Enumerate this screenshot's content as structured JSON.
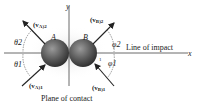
{
  "diagram": {
    "axes": {
      "x": "x",
      "y": "y"
    },
    "bodies": [
      {
        "label": "A"
      },
      {
        "label": "B"
      }
    ],
    "velocities": {
      "vA1": "(v",
      "vA1_sub": "A",
      "vA1_post": ")1",
      "vA2": "(v",
      "vA2_sub": "A",
      "vA2_post": ")2",
      "vB1": "(v",
      "vB1_sub": "B",
      "vB1_post": ")1",
      "vB2": "(v",
      "vB2_sub": "B",
      "vB2_post": ")2"
    },
    "angles": {
      "theta1": "θ1",
      "theta2": "θ2",
      "phi1": "φ1",
      "phi2": "φ2"
    },
    "line_of_impact_label": "Line of impact",
    "plane_of_contact_label": "Plane of contact",
    "contact_marker": "1"
  }
}
